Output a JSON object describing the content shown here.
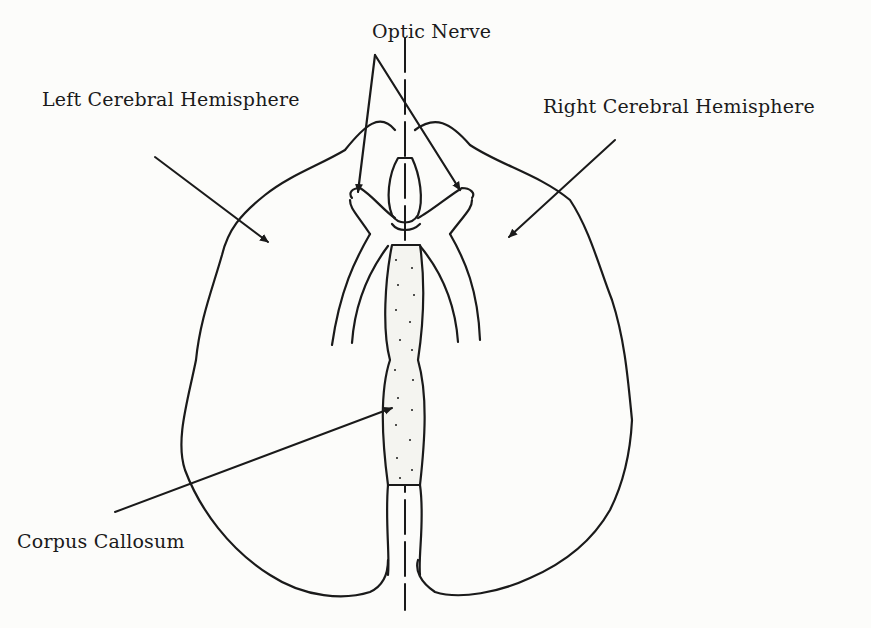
{
  "diagram": {
    "type": "anatomical line drawing",
    "colors": {
      "ink": "#1a1a1a",
      "paper": "#fcfcfa"
    },
    "labels": {
      "optic_nerve": "Optic Nerve",
      "left_hemisphere": "Left Cerebral Hemisphere",
      "right_hemisphere": "Right Cerebral Hemisphere",
      "corpus_callosum": "Corpus Callosum"
    }
  }
}
